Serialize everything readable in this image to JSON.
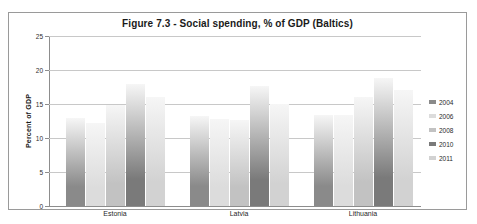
{
  "chart_data": {
    "type": "bar",
    "title": "Figure 7.3 - Social spending, % of GDP (Baltics)",
    "xlabel": "",
    "ylabel": "Percent of GDP",
    "ylim": [
      0,
      25
    ],
    "ytick_step": 5,
    "yticks": [
      0,
      5,
      10,
      15,
      20,
      25
    ],
    "ytick_labels": [
      "0",
      "5",
      "10",
      "15",
      "20",
      "25"
    ],
    "grid": true,
    "legend_position": "right",
    "categories": [
      "Estonia",
      "Latvia",
      "Lithuania"
    ],
    "series": [
      {
        "name": "2004",
        "values": [
          12.9,
          13.2,
          13.4
        ],
        "color": "#8a8a8a"
      },
      {
        "name": "2006",
        "values": [
          12.2,
          12.8,
          13.4
        ],
        "color": "#dcdcdc"
      },
      {
        "name": "2008",
        "values": [
          14.8,
          12.7,
          16.0
        ],
        "color": "#c2c2c2"
      },
      {
        "name": "2010",
        "values": [
          18.0,
          17.7,
          18.8
        ],
        "color": "#7a7a7a"
      },
      {
        "name": "2011",
        "values": [
          16.1,
          15.0,
          17.0
        ],
        "color": "#d2d2d2"
      }
    ]
  },
  "legend": {
    "items": [
      {
        "label": "2004"
      },
      {
        "label": "2006"
      },
      {
        "label": "2008"
      },
      {
        "label": "2010"
      },
      {
        "label": "2011"
      }
    ]
  }
}
